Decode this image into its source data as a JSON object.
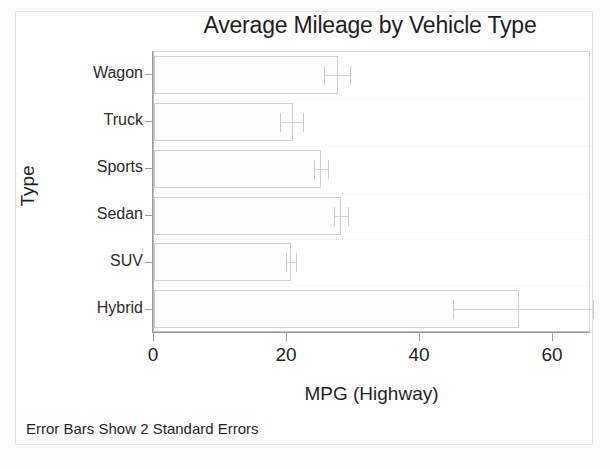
{
  "chart_data": {
    "type": "bar",
    "orientation": "horizontal",
    "title": "Average Mileage by Vehicle Type",
    "xlabel": "MPG (Highway)",
    "ylabel": "Type",
    "categories": [
      "Wagon",
      "Truck",
      "Sports",
      "Sedan",
      "SUV",
      "Hybrid"
    ],
    "values": [
      27.7,
      20.9,
      25.1,
      28.1,
      20.6,
      54.9
    ],
    "error_low": [
      25.6,
      19.0,
      24.0,
      27.0,
      19.8,
      45.0
    ],
    "error_high": [
      29.5,
      22.4,
      26.1,
      29.2,
      21.4,
      66.0
    ],
    "error_description": "Error Bars Show 2 Standard Errors",
    "xlim": [
      0,
      65.7
    ],
    "xticks": [
      0,
      20,
      40,
      60
    ],
    "xtick_labels": [
      "0",
      "20",
      "40",
      "60"
    ],
    "grid": false,
    "legend": "none",
    "series": [
      {
        "name": "Average MPG (Highway)",
        "values": [
          27.7,
          20.9,
          25.1,
          28.1,
          20.6,
          54.9
        ]
      }
    ]
  },
  "footnote": "Error Bars Show 2 Standard Errors",
  "colors": {
    "bar_fill": "#fdfdfd",
    "bar_border": "#cfcfcf",
    "axis": "#9a9a9a",
    "text": "#1f1f1f",
    "frame": "#d8d8d8",
    "background": "#ffffff"
  }
}
